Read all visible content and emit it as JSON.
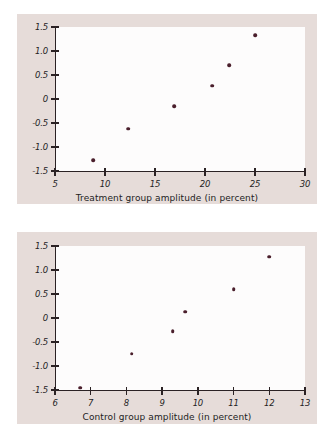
{
  "figure": {
    "background": "#ffffff",
    "panel_background": "#e6dcd9",
    "point_color": "#4a1f2c",
    "axis_color": "#2b2224"
  },
  "chart_data": [
    {
      "type": "scatter",
      "id": "treatment",
      "title": "",
      "xlabel": "Treatment group amplitude (in percent)",
      "ylabel": "",
      "xlim": [
        5,
        30
      ],
      "ylim": [
        -1.5,
        1.5
      ],
      "xticks": [
        5,
        10,
        15,
        20,
        25,
        30
      ],
      "xtick_labels": [
        "5",
        "10",
        "15",
        "20",
        "25",
        "30"
      ],
      "yticks": [
        -1.5,
        -1.0,
        -0.5,
        0,
        0.5,
        1.0,
        1.5
      ],
      "ytick_labels": [
        "-1.5",
        "-1.0",
        "-0.5",
        "0",
        "0.5",
        "1.0",
        "1.5"
      ],
      "grid": false,
      "legend": false,
      "x": [
        8.8,
        12.3,
        16.9,
        20.7,
        22.4,
        25.0
      ],
      "y": [
        -1.28,
        -0.62,
        -0.15,
        0.28,
        0.71,
        1.33
      ]
    },
    {
      "type": "scatter",
      "id": "control",
      "title": "",
      "xlabel": "Control group amplitude (in percent)",
      "ylabel": "",
      "xlim": [
        6,
        13
      ],
      "ylim": [
        -1.5,
        1.5
      ],
      "xticks": [
        6,
        7,
        8,
        9,
        10,
        11,
        12,
        13
      ],
      "xtick_labels": [
        "6",
        "7",
        "8",
        "9",
        "10",
        "11",
        "12",
        "13"
      ],
      "yticks": [
        -1.5,
        -1.0,
        -0.5,
        0,
        0.5,
        1.0,
        1.5
      ],
      "ytick_labels": [
        "-1.5",
        "-1.0",
        "-0.5",
        "0",
        "0.5",
        "1.0",
        "1.5"
      ],
      "grid": false,
      "legend": false,
      "x": [
        6.7,
        8.15,
        9.3,
        9.65,
        11.0,
        12.0
      ],
      "y": [
        -1.45,
        -0.74,
        -0.28,
        0.13,
        0.6,
        1.28
      ]
    }
  ]
}
